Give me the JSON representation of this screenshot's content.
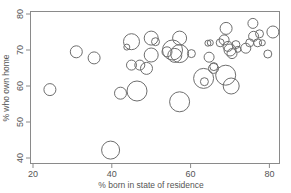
{
  "chart_data": {
    "type": "scatter",
    "subtype": "bubble",
    "title": "",
    "xlabel": "% born in state of residence",
    "ylabel": "% who own home",
    "xlim": [
      18,
      83
    ],
    "ylim": [
      39,
      81
    ],
    "xticks": [
      20,
      40,
      60,
      80
    ],
    "yticks": [
      40,
      50,
      60,
      70,
      80
    ],
    "grid": false,
    "legend": null,
    "marker": "open circle, size proportional to third variable",
    "colors": {
      "frame": "#8a8a8a",
      "bubble": "#6e6e6e",
      "text": "#555555"
    },
    "points": [
      {
        "x": 24.3,
        "y": 59.0,
        "r": 6
      },
      {
        "x": 31.0,
        "y": 69.5,
        "r": 6
      },
      {
        "x": 35.5,
        "y": 67.8,
        "r": 6
      },
      {
        "x": 39.7,
        "y": 42.2,
        "r": 9
      },
      {
        "x": 42.2,
        "y": 58.0,
        "r": 6
      },
      {
        "x": 46.4,
        "y": 58.6,
        "r": 10
      },
      {
        "x": 43.8,
        "y": 70.8,
        "r": 3
      },
      {
        "x": 45.0,
        "y": 72.3,
        "r": 8
      },
      {
        "x": 45.0,
        "y": 65.8,
        "r": 5
      },
      {
        "x": 47.1,
        "y": 65.8,
        "r": 5
      },
      {
        "x": 48.8,
        "y": 64.9,
        "r": 6
      },
      {
        "x": 50.0,
        "y": 73.3,
        "r": 7
      },
      {
        "x": 51.1,
        "y": 72.3,
        "r": 4
      },
      {
        "x": 50.0,
        "y": 68.6,
        "r": 7
      },
      {
        "x": 54.0,
        "y": 69.5,
        "r": 5
      },
      {
        "x": 55.4,
        "y": 70.0,
        "r": 10
      },
      {
        "x": 57.2,
        "y": 69.0,
        "r": 9
      },
      {
        "x": 56.0,
        "y": 68.5,
        "r": 7
      },
      {
        "x": 57.2,
        "y": 73.3,
        "r": 7
      },
      {
        "x": 60.2,
        "y": 69.0,
        "r": 4
      },
      {
        "x": 57.2,
        "y": 55.6,
        "r": 10
      },
      {
        "x": 63.3,
        "y": 62.1,
        "r": 10
      },
      {
        "x": 63.5,
        "y": 61.2,
        "r": 4
      },
      {
        "x": 64.4,
        "y": 71.9,
        "r": 3
      },
      {
        "x": 65.0,
        "y": 72.0,
        "r": 3
      },
      {
        "x": 64.7,
        "y": 68.0,
        "r": 5
      },
      {
        "x": 65.9,
        "y": 65.4,
        "r": 4
      },
      {
        "x": 65.8,
        "y": 64.9,
        "r": 5
      },
      {
        "x": 67.5,
        "y": 72.0,
        "r": 4
      },
      {
        "x": 68.5,
        "y": 72.8,
        "r": 5
      },
      {
        "x": 69.0,
        "y": 76.0,
        "r": 6
      },
      {
        "x": 69.5,
        "y": 71.0,
        "r": 5
      },
      {
        "x": 70.0,
        "y": 70.0,
        "r": 6
      },
      {
        "x": 70.5,
        "y": 69.0,
        "r": 5
      },
      {
        "x": 68.9,
        "y": 63.0,
        "r": 10
      },
      {
        "x": 70.3,
        "y": 60.0,
        "r": 8
      },
      {
        "x": 71.5,
        "y": 71.5,
        "r": 4
      },
      {
        "x": 72.0,
        "y": 70.2,
        "r": 3
      },
      {
        "x": 74.0,
        "y": 70.5,
        "r": 5
      },
      {
        "x": 75.0,
        "y": 72.0,
        "r": 4
      },
      {
        "x": 75.8,
        "y": 77.4,
        "r": 5
      },
      {
        "x": 76.0,
        "y": 73.8,
        "r": 5
      },
      {
        "x": 77.0,
        "y": 72.0,
        "r": 4
      },
      {
        "x": 77.5,
        "y": 74.5,
        "r": 4
      },
      {
        "x": 78.2,
        "y": 72.0,
        "r": 3
      },
      {
        "x": 79.6,
        "y": 68.9,
        "r": 4
      },
      {
        "x": 80.9,
        "y": 75.0,
        "r": 6
      }
    ]
  }
}
